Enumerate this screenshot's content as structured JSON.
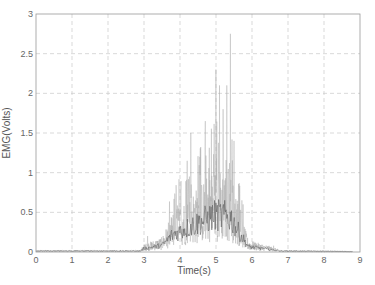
{
  "chart_data": {
    "type": "line",
    "title": "",
    "xlabel": "Time(s)",
    "ylabel": "EMG(Volts)",
    "xlim": [
      0,
      9
    ],
    "ylim": [
      0,
      3
    ],
    "xticks": [
      0,
      1,
      2,
      3,
      4,
      5,
      6,
      7,
      8,
      9
    ],
    "yticks": [
      0,
      0.5,
      1,
      1.5,
      2,
      2.5,
      3
    ],
    "ytick_labels": [
      "0",
      "0.5",
      "1",
      "1.5",
      "2",
      "2.5",
      "3"
    ],
    "grid": true,
    "grid_style": "dashed",
    "legend": null,
    "series": [
      {
        "name": "EMG signal",
        "color": "#555555",
        "description": "Raw EMG: baseline ~0.02 V from 0-3 s, burst of activity 3-6.5 s with envelope peaking around 5-5.5 s, return to baseline after ~6.8 s, signal ends ~8.8 s",
        "envelope": [
          {
            "t": 0.0,
            "v": 0.02
          },
          {
            "t": 2.9,
            "v": 0.02
          },
          {
            "t": 3.0,
            "v": 0.08
          },
          {
            "t": 3.5,
            "v": 0.15
          },
          {
            "t": 3.8,
            "v": 0.4
          },
          {
            "t": 4.2,
            "v": 0.55
          },
          {
            "t": 4.6,
            "v": 0.7
          },
          {
            "t": 5.0,
            "v": 0.85
          },
          {
            "t": 5.4,
            "v": 0.8
          },
          {
            "t": 5.6,
            "v": 0.5
          },
          {
            "t": 5.9,
            "v": 0.12
          },
          {
            "t": 6.5,
            "v": 0.06
          },
          {
            "t": 6.8,
            "v": 0.02
          },
          {
            "t": 8.8,
            "v": 0.01
          }
        ],
        "peaks": [
          {
            "t": 3.1,
            "v": 0.2
          },
          {
            "t": 3.9,
            "v": 0.75
          },
          {
            "t": 4.2,
            "v": 1.15
          },
          {
            "t": 4.3,
            "v": 1.5
          },
          {
            "t": 4.55,
            "v": 1.2
          },
          {
            "t": 4.7,
            "v": 1.65
          },
          {
            "t": 4.95,
            "v": 1.45
          },
          {
            "t": 5.0,
            "v": 2.3
          },
          {
            "t": 5.1,
            "v": 2.1
          },
          {
            "t": 5.2,
            "v": 1.8
          },
          {
            "t": 5.3,
            "v": 2.1
          },
          {
            "t": 5.4,
            "v": 2.75
          },
          {
            "t": 5.5,
            "v": 1.4
          },
          {
            "t": 5.75,
            "v": 0.6
          },
          {
            "t": 6.6,
            "v": 0.08
          }
        ],
        "t_end": 8.8
      }
    ]
  }
}
